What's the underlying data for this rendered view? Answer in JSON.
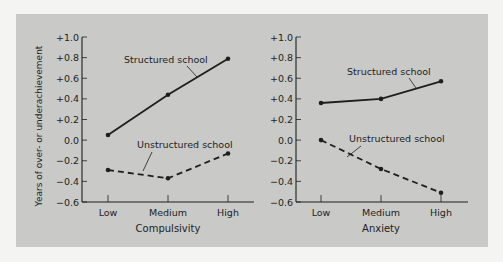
{
  "figure": {
    "background": "#f4f4f2",
    "panel_color": "#c9c9c7",
    "ink_color": "#1e1e1e",
    "ylabel": "Years of over- or underachievement"
  },
  "chart_data": [
    {
      "type": "line",
      "title": "",
      "xlabel": "Compulsivity",
      "ylabel": "Years of over- or underachievement",
      "categories": [
        "Low",
        "Medium",
        "High"
      ],
      "yticks": [
        "+1.0",
        "+0.8",
        "+0.6",
        "+0.4",
        "+0.2",
        "0.0",
        "−0.2",
        "−0.4",
        "−0.6"
      ],
      "ytick_values": [
        1.0,
        0.8,
        0.6,
        0.4,
        0.2,
        0.0,
        -0.2,
        -0.4,
        -0.6
      ],
      "ylim": [
        -0.6,
        1.0
      ],
      "grid": false,
      "legend": "inline labels",
      "series": [
        {
          "name": "Structured school",
          "style": "solid",
          "values": [
            0.05,
            0.44,
            0.79
          ]
        },
        {
          "name": "Unstructured school",
          "style": "dashed",
          "values": [
            -0.29,
            -0.37,
            -0.13
          ]
        }
      ]
    },
    {
      "type": "line",
      "title": "",
      "xlabel": "Anxiety",
      "ylabel": "",
      "categories": [
        "Low",
        "Medium",
        "High"
      ],
      "yticks": [
        "+1.0",
        "+0.8",
        "+0.6",
        "+0.4",
        "+0.2",
        "0.0",
        "−0.2",
        "−0.4",
        "−0.6"
      ],
      "ytick_values": [
        1.0,
        0.8,
        0.6,
        0.4,
        0.2,
        0.0,
        -0.2,
        -0.4,
        -0.6
      ],
      "ylim": [
        -0.6,
        1.0
      ],
      "grid": false,
      "legend": "inline labels",
      "series": [
        {
          "name": "Structured school",
          "style": "solid",
          "values": [
            0.36,
            0.4,
            0.57
          ]
        },
        {
          "name": "Unstructured school",
          "style": "dashed",
          "values": [
            0.0,
            -0.28,
            -0.51
          ]
        }
      ]
    }
  ]
}
